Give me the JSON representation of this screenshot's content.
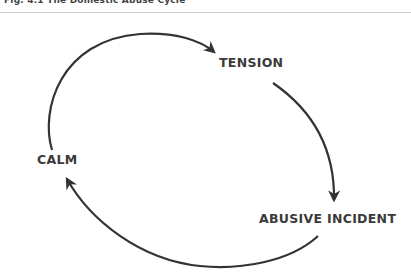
{
  "figure": {
    "title": "Fig. 4.1 The Domestic Abuse Cycle"
  },
  "diagram": {
    "type": "cycle",
    "stages": [
      {
        "id": "tension",
        "label": "TENSION"
      },
      {
        "id": "abusive-incident",
        "label": "ABUSIVE INCIDENT"
      },
      {
        "id": "calm",
        "label": "CALM"
      }
    ],
    "edges": [
      {
        "from": "calm",
        "to": "tension"
      },
      {
        "from": "tension",
        "to": "abusive-incident"
      },
      {
        "from": "abusive-incident",
        "to": "calm"
      }
    ],
    "colors": {
      "stroke": "#333333",
      "text": "#3a3a3a",
      "divider": "#cfcfcf",
      "background": "#ffffff"
    }
  }
}
